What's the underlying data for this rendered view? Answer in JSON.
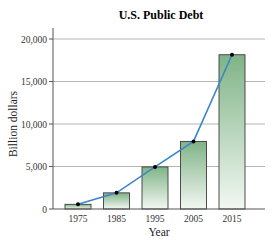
{
  "chart_data": {
    "type": "bar",
    "title": "U.S. Public Debt",
    "xlabel": "Year",
    "ylabel": "Billion dollars",
    "categories": [
      "1975",
      "1985",
      "1995",
      "2005",
      "2015"
    ],
    "values": [
      550,
      1900,
      4950,
      7950,
      18150
    ],
    "series": [
      {
        "name": "Public debt (bars)",
        "values": [
          550,
          1900,
          4950,
          7950,
          18150
        ]
      },
      {
        "name": "Trend line",
        "values": [
          550,
          1900,
          4950,
          7950,
          18150
        ]
      }
    ],
    "yticks": [
      0,
      5000,
      10000,
      15000,
      20000
    ],
    "ytick_labels": [
      "0",
      "5,000",
      "10,000",
      "15,000",
      "20,000"
    ],
    "ylim": [
      0,
      20000
    ],
    "grid": true,
    "legend": "none",
    "colors": {
      "bar_top": "#7fb386",
      "bar_bottom": "#f3f8f3",
      "bar_border": "#3d3d3d",
      "line": "#3a86c8",
      "marker": "#000000",
      "grid": "#b5b5b5"
    }
  }
}
